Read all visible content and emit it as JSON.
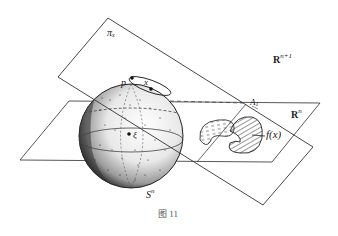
{
  "figure": {
    "caption": "图 11",
    "labels": {
      "plane_pi": {
        "base": "π",
        "sub": "x"
      },
      "space_big": {
        "base": "R",
        "sup": "n+1"
      },
      "space_small": {
        "base": "R",
        "sup": "n"
      },
      "point_p": "p",
      "point_x": "x",
      "point_xi": "ξ",
      "region_A": {
        "base": "A",
        "sub": "1"
      },
      "map_label": "f(x)",
      "sphere": {
        "base": "S",
        "sup": "n"
      }
    },
    "colors": {
      "line": "#333333",
      "background": "#ffffff",
      "stipple": "#1a1a1a"
    }
  }
}
